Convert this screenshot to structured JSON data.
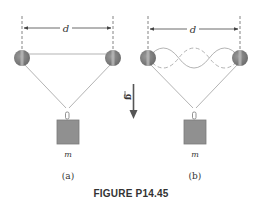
{
  "figure": {
    "caption": "FIGURE P14.45",
    "gravity_label": "g",
    "colors": {
      "line": "#999999",
      "dark_line": "#555555",
      "pulley": "#808080",
      "pulley_highlight": "#b5b5b5",
      "mass": "#909090",
      "mass_border": "#777777",
      "arrow": "#555555",
      "text": "#333333"
    },
    "panels": [
      {
        "id": "a",
        "label": "(a)",
        "distance_label": "d",
        "mass_label": "m",
        "string_state": "straight"
      },
      {
        "id": "b",
        "label": "(b)",
        "distance_label": "d",
        "mass_label": "m",
        "string_state": "standing-wave"
      }
    ]
  }
}
